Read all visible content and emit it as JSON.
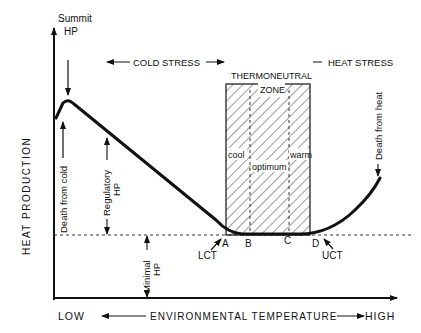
{
  "diagram": {
    "y_axis": {
      "label": "HEAT PRODUCTION"
    },
    "x_axis": {
      "low": "LOW",
      "label": "ENVIRONMENTAL TEMPERATURE",
      "high": "HIGH"
    },
    "regions": {
      "cold_stress": "COLD STRESS",
      "heat_stress": "HEAT STRESS",
      "thermoneutral_line1": "THERMONEUTRAL",
      "thermoneutral_line2": "ZONE"
    },
    "zone_labels": {
      "cool": "cool",
      "optimum": "optimum",
      "warm": "warm"
    },
    "points": {
      "A": "A",
      "B": "B",
      "C": "C",
      "D": "D"
    },
    "annotations": {
      "summit_line1": "Summit",
      "summit_line2": "HP",
      "death_cold": "Death from cold",
      "regulatory_line1": "Regulatory",
      "regulatory_line2": "HP",
      "minimal_line1": "Minimal",
      "minimal_line2": "HP",
      "death_heat": "Death from heat",
      "lct": "LCT",
      "uct": "UCT"
    },
    "colors": {
      "ink": "#111111",
      "background": "#ffffff"
    }
  }
}
